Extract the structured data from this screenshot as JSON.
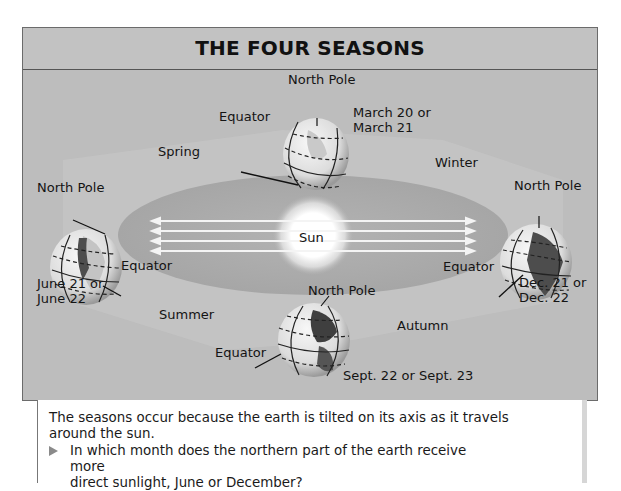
{
  "title": "THE FOUR SEASONS",
  "sun_label": "Sun",
  "seasons": {
    "spring": "Spring",
    "winter": "Winter",
    "summer": "Summer",
    "autumn": "Autumn"
  },
  "earth_positions": {
    "top": {
      "pole_label": "North Pole",
      "equator_label": "Equator",
      "date_line1": "March 20 or",
      "date_line2": "March 21"
    },
    "left": {
      "pole_label": "North Pole",
      "equator_label": "Equator",
      "date_line1": "June 21 or",
      "date_line2": "June 22"
    },
    "right": {
      "pole_label": "North Pole",
      "equator_label": "Equator",
      "date_line1": "Dec. 21 or",
      "date_line2": "Dec. 22"
    },
    "bottom": {
      "pole_label": "North Pole",
      "equator_label": "Equator",
      "date_line1": "Sept. 22 or Sept. 23"
    }
  },
  "caption": {
    "line1": "The seasons occur because the earth is tilted on its axis as it travels",
    "line2": "around the sun.",
    "question_line1": "In which month does the northern part of the earth receive more",
    "question_line2": "direct sunlight, June or December?"
  },
  "colors": {
    "frame_bg": "#bdbdbd",
    "orbit_band": "#a9a9a9",
    "sun_glow": "#ffffff",
    "globe_fill": "#e6e6e6",
    "globe_land": "#5a5a5a"
  }
}
